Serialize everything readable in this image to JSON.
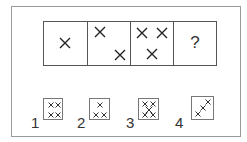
{
  "puzzle": {
    "sequence": [
      {
        "label": "cell-1",
        "marks": 1
      },
      {
        "label": "cell-2",
        "marks": 2
      },
      {
        "label": "cell-3",
        "marks": 3
      },
      {
        "label": "cell-4",
        "content": "?"
      }
    ],
    "options": [
      {
        "number": "1",
        "description": "four crosses in a 2x2 grid"
      },
      {
        "number": "2",
        "description": "three crosses: one top, two bottom"
      },
      {
        "number": "3",
        "description": "five crosses: 2x2 corners plus center"
      },
      {
        "number": "4",
        "description": "three crosses along a diagonal"
      }
    ],
    "colors": {
      "line": "#555555",
      "mark": "#222222",
      "frame": "#9a9a9a"
    }
  }
}
